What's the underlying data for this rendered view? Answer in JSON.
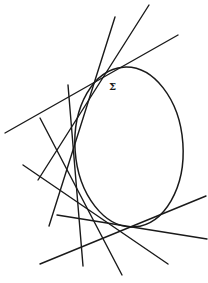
{
  "diagram": {
    "curve": {
      "label": "Σ",
      "shape": "ellipse",
      "cx": 129,
      "cy": 147,
      "rx": 54,
      "ry": 80,
      "rotate": -4,
      "label_pos": {
        "x": 109,
        "y": 90
      }
    },
    "tangent_lines": [
      {
        "id": "A",
        "x1": 5,
        "y1": 133,
        "x2": 178,
        "y2": 35
      },
      {
        "id": "B",
        "x1": 149,
        "y1": 5,
        "x2": 38,
        "y2": 180
      },
      {
        "id": "C",
        "x1": 115,
        "y1": 17,
        "x2": 49,
        "y2": 226
      },
      {
        "id": "D",
        "x1": 68,
        "y1": 85,
        "x2": 83,
        "y2": 266
      },
      {
        "id": "E",
        "x1": 40,
        "y1": 118,
        "x2": 122,
        "y2": 275
      },
      {
        "id": "F",
        "x1": 23,
        "y1": 165,
        "x2": 168,
        "y2": 264
      },
      {
        "id": "G",
        "x1": 57,
        "y1": 215,
        "x2": 207,
        "y2": 239
      },
      {
        "id": "H",
        "x1": 40,
        "y1": 264,
        "x2": 206,
        "y2": 196
      }
    ],
    "stroke_color": "#1a1a1a",
    "background": "#ffffff"
  }
}
